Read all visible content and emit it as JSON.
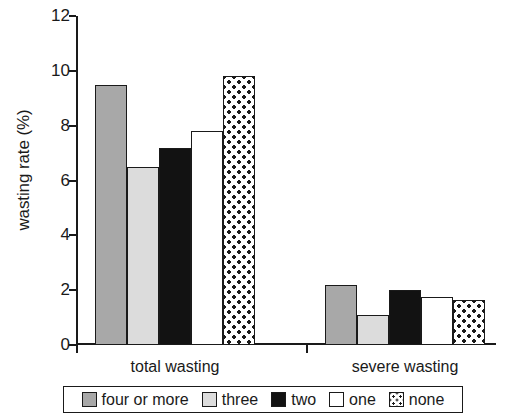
{
  "chart_data": {
    "type": "bar",
    "title": "",
    "xlabel": "",
    "ylabel": "wasting rate (%)",
    "categories": [
      "total wasting",
      "severe wasting"
    ],
    "series": [
      {
        "name": "four or more",
        "values": [
          9.5,
          2.2
        ],
        "fill": "medium-gray",
        "color": "#a8a8a8"
      },
      {
        "name": "three",
        "values": [
          6.5,
          1.1
        ],
        "fill": "light-gray",
        "color": "#dcdcdc"
      },
      {
        "name": "two",
        "values": [
          7.2,
          2.0
        ],
        "fill": "black",
        "color": "#121212"
      },
      {
        "name": "one",
        "values": [
          7.8,
          1.75
        ],
        "fill": "white",
        "color": "#ffffff"
      },
      {
        "name": "none",
        "values": [
          9.8,
          1.65
        ],
        "fill": "dotted",
        "color": "#ffffff"
      }
    ],
    "ylim": [
      0,
      12
    ],
    "yticks": [
      0,
      2,
      4,
      6,
      8,
      10,
      12
    ],
    "ytick_labels": [
      "0",
      "2",
      "4",
      "6",
      "8",
      "10",
      "12"
    ],
    "grid": false,
    "legend_position": "bottom"
  },
  "legend": {
    "items": [
      {
        "label": "four or more",
        "swatch": "swatch-medium-gray"
      },
      {
        "label": "three",
        "swatch": "swatch-light-gray"
      },
      {
        "label": "two",
        "swatch": "swatch-black"
      },
      {
        "label": "one",
        "swatch": "swatch-white"
      },
      {
        "label": "none",
        "swatch": "swatch-dotted"
      }
    ]
  }
}
